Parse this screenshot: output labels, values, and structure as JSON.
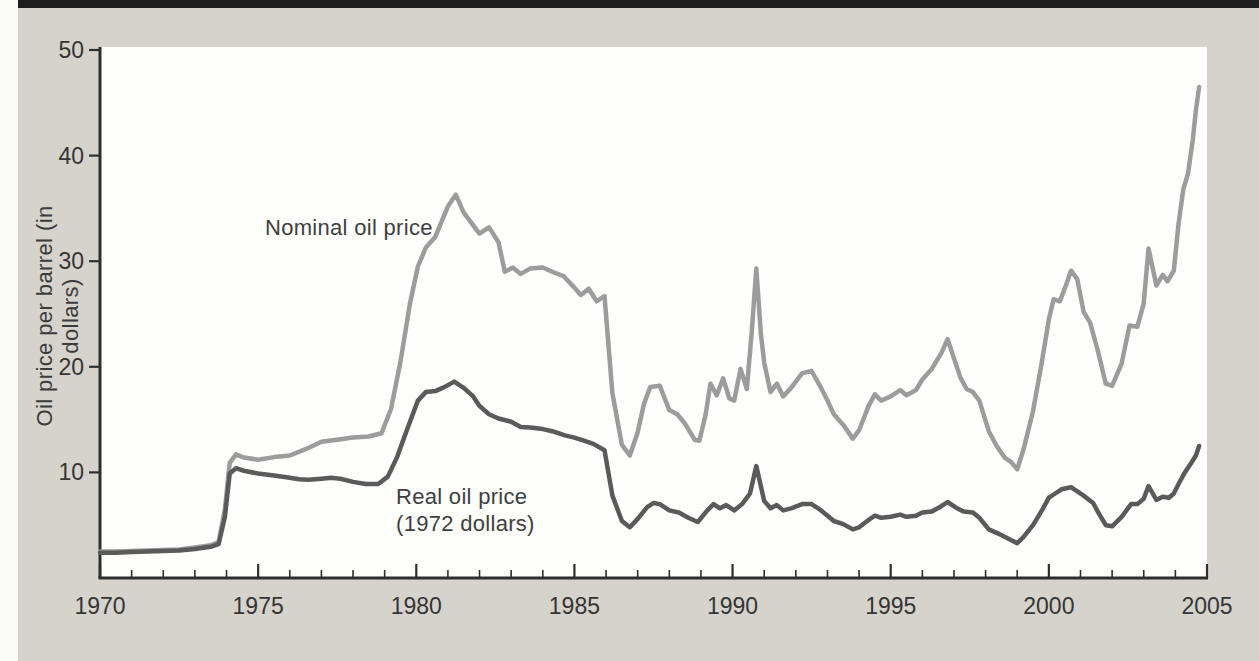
{
  "figure": {
    "y_axis_title": "Oil price per barrel (in dollars)",
    "nominal_label": "Nominal oil price",
    "real_label_line1": "Real oil price",
    "real_label_line2": "(1972 dollars)"
  },
  "colors": {
    "page_background": "#d5d3cc",
    "plot_background": "#fdfdfb",
    "top_bar": "#1e1e1e",
    "axis": "#2e2e2e",
    "tick_text": "#353535",
    "nominal_line": "#9c9c9c",
    "real_line": "#5a5a5a"
  },
  "chart_data": {
    "type": "line",
    "title": "",
    "xlabel": "",
    "ylabel": "Oil price per barrel (in dollars)",
    "xlim": [
      1970,
      2005
    ],
    "ylim": [
      0,
      50
    ],
    "x_ticks_major": [
      1970,
      1975,
      1980,
      1985,
      1990,
      1995,
      2000,
      2005
    ],
    "x_minor_tick_step_years": 1,
    "y_ticks": [
      10,
      20,
      30,
      40,
      50
    ],
    "grid": false,
    "legend": "inline annotations on lines",
    "annotations": [
      "Nominal oil price",
      "Real oil price (1972 dollars)"
    ],
    "series": [
      {
        "name": "Nominal oil price",
        "color_key": "nominal_line",
        "points": [
          [
            1970.0,
            2.5
          ],
          [
            1970.5,
            2.5
          ],
          [
            1971.0,
            2.55
          ],
          [
            1971.5,
            2.6
          ],
          [
            1972.0,
            2.65
          ],
          [
            1972.5,
            2.7
          ],
          [
            1973.0,
            2.9
          ],
          [
            1973.5,
            3.1
          ],
          [
            1973.75,
            3.4
          ],
          [
            1973.95,
            6.5
          ],
          [
            1974.1,
            10.9
          ],
          [
            1974.3,
            11.7
          ],
          [
            1974.55,
            11.4
          ],
          [
            1975.0,
            11.2
          ],
          [
            1975.5,
            11.45
          ],
          [
            1976.0,
            11.6
          ],
          [
            1976.5,
            12.2
          ],
          [
            1977.0,
            12.9
          ],
          [
            1977.5,
            13.1
          ],
          [
            1978.0,
            13.3
          ],
          [
            1978.5,
            13.4
          ],
          [
            1978.9,
            13.7
          ],
          [
            1979.2,
            16.0
          ],
          [
            1979.5,
            20.5
          ],
          [
            1979.8,
            26.0
          ],
          [
            1980.05,
            29.5
          ],
          [
            1980.3,
            31.3
          ],
          [
            1980.6,
            32.3
          ],
          [
            1981.0,
            35.2
          ],
          [
            1981.25,
            36.3
          ],
          [
            1981.5,
            34.6
          ],
          [
            1981.75,
            33.6
          ],
          [
            1982.0,
            32.6
          ],
          [
            1982.3,
            33.2
          ],
          [
            1982.6,
            31.8
          ],
          [
            1982.8,
            29.0
          ],
          [
            1983.05,
            29.4
          ],
          [
            1983.3,
            28.8
          ],
          [
            1983.6,
            29.3
          ],
          [
            1984.0,
            29.4
          ],
          [
            1984.3,
            29.0
          ],
          [
            1984.65,
            28.6
          ],
          [
            1985.0,
            27.5
          ],
          [
            1985.2,
            26.8
          ],
          [
            1985.45,
            27.4
          ],
          [
            1985.7,
            26.2
          ],
          [
            1985.95,
            26.7
          ],
          [
            1986.2,
            17.5
          ],
          [
            1986.5,
            12.6
          ],
          [
            1986.75,
            11.6
          ],
          [
            1987.0,
            13.8
          ],
          [
            1987.2,
            16.5
          ],
          [
            1987.4,
            18.1
          ],
          [
            1987.7,
            18.2
          ],
          [
            1988.0,
            15.9
          ],
          [
            1988.25,
            15.5
          ],
          [
            1988.5,
            14.6
          ],
          [
            1988.8,
            13.1
          ],
          [
            1988.95,
            13.0
          ],
          [
            1989.15,
            15.5
          ],
          [
            1989.3,
            18.4
          ],
          [
            1989.5,
            17.3
          ],
          [
            1989.7,
            18.9
          ],
          [
            1989.9,
            17.0
          ],
          [
            1990.05,
            16.8
          ],
          [
            1990.25,
            19.8
          ],
          [
            1990.45,
            17.9
          ],
          [
            1990.6,
            23.0
          ],
          [
            1990.75,
            29.3
          ],
          [
            1990.9,
            23.0
          ],
          [
            1991.0,
            20.4
          ],
          [
            1991.2,
            17.6
          ],
          [
            1991.4,
            18.4
          ],
          [
            1991.6,
            17.2
          ],
          [
            1991.85,
            18.0
          ],
          [
            1992.2,
            19.4
          ],
          [
            1992.5,
            19.6
          ],
          [
            1992.8,
            18.0
          ],
          [
            1993.0,
            16.8
          ],
          [
            1993.2,
            15.5
          ],
          [
            1993.5,
            14.5
          ],
          [
            1993.8,
            13.2
          ],
          [
            1994.0,
            14.0
          ],
          [
            1994.3,
            16.3
          ],
          [
            1994.5,
            17.4
          ],
          [
            1994.7,
            16.8
          ],
          [
            1995.0,
            17.2
          ],
          [
            1995.3,
            17.8
          ],
          [
            1995.5,
            17.3
          ],
          [
            1995.8,
            17.8
          ],
          [
            1996.0,
            18.8
          ],
          [
            1996.3,
            19.8
          ],
          [
            1996.6,
            21.3
          ],
          [
            1996.8,
            22.6
          ],
          [
            1997.0,
            20.8
          ],
          [
            1997.2,
            19.0
          ],
          [
            1997.4,
            17.9
          ],
          [
            1997.6,
            17.6
          ],
          [
            1997.8,
            16.8
          ],
          [
            1998.1,
            13.9
          ],
          [
            1998.35,
            12.5
          ],
          [
            1998.6,
            11.4
          ],
          [
            1998.8,
            11.0
          ],
          [
            1999.0,
            10.3
          ],
          [
            1999.2,
            12.2
          ],
          [
            1999.5,
            15.8
          ],
          [
            1999.75,
            20.0
          ],
          [
            2000.0,
            24.5
          ],
          [
            2000.15,
            26.4
          ],
          [
            2000.35,
            26.2
          ],
          [
            2000.55,
            27.8
          ],
          [
            2000.7,
            29.1
          ],
          [
            2000.9,
            28.3
          ],
          [
            2001.1,
            25.2
          ],
          [
            2001.3,
            24.2
          ],
          [
            2001.55,
            21.5
          ],
          [
            2001.8,
            18.4
          ],
          [
            2002.0,
            18.2
          ],
          [
            2002.3,
            20.3
          ],
          [
            2002.55,
            23.9
          ],
          [
            2002.8,
            23.8
          ],
          [
            2003.0,
            26.0
          ],
          [
            2003.15,
            31.2
          ],
          [
            2003.4,
            27.7
          ],
          [
            2003.6,
            28.7
          ],
          [
            2003.75,
            28.1
          ],
          [
            2003.95,
            29.1
          ],
          [
            2004.1,
            33.5
          ],
          [
            2004.25,
            36.8
          ],
          [
            2004.4,
            38.3
          ],
          [
            2004.55,
            41.5
          ],
          [
            2004.65,
            44.3
          ],
          [
            2004.75,
            46.5
          ]
        ]
      },
      {
        "name": "Real oil price (1972 dollars)",
        "color_key": "real_line",
        "points": [
          [
            1970.0,
            2.4
          ],
          [
            1970.5,
            2.4
          ],
          [
            1971.0,
            2.45
          ],
          [
            1971.5,
            2.5
          ],
          [
            1972.0,
            2.55
          ],
          [
            1972.5,
            2.6
          ],
          [
            1973.0,
            2.75
          ],
          [
            1973.5,
            2.95
          ],
          [
            1973.75,
            3.2
          ],
          [
            1973.95,
            5.8
          ],
          [
            1974.1,
            9.9
          ],
          [
            1974.3,
            10.4
          ],
          [
            1974.55,
            10.15
          ],
          [
            1975.0,
            9.9
          ],
          [
            1975.5,
            9.7
          ],
          [
            1976.0,
            9.5
          ],
          [
            1976.3,
            9.35
          ],
          [
            1976.6,
            9.3
          ],
          [
            1977.0,
            9.4
          ],
          [
            1977.3,
            9.5
          ],
          [
            1977.6,
            9.4
          ],
          [
            1978.0,
            9.1
          ],
          [
            1978.4,
            8.9
          ],
          [
            1978.8,
            8.9
          ],
          [
            1979.1,
            9.6
          ],
          [
            1979.4,
            11.5
          ],
          [
            1979.7,
            14.0
          ],
          [
            1980.05,
            16.8
          ],
          [
            1980.3,
            17.6
          ],
          [
            1980.6,
            17.7
          ],
          [
            1980.9,
            18.1
          ],
          [
            1981.2,
            18.6
          ],
          [
            1981.5,
            18.0
          ],
          [
            1981.8,
            17.2
          ],
          [
            1982.0,
            16.3
          ],
          [
            1982.3,
            15.5
          ],
          [
            1982.6,
            15.1
          ],
          [
            1983.0,
            14.8
          ],
          [
            1983.3,
            14.3
          ],
          [
            1983.6,
            14.25
          ],
          [
            1984.0,
            14.1
          ],
          [
            1984.3,
            13.9
          ],
          [
            1984.7,
            13.5
          ],
          [
            1985.0,
            13.3
          ],
          [
            1985.3,
            13.0
          ],
          [
            1985.6,
            12.7
          ],
          [
            1985.95,
            12.1
          ],
          [
            1986.2,
            7.8
          ],
          [
            1986.5,
            5.4
          ],
          [
            1986.75,
            4.8
          ],
          [
            1987.0,
            5.6
          ],
          [
            1987.3,
            6.7
          ],
          [
            1987.5,
            7.1
          ],
          [
            1987.7,
            7.0
          ],
          [
            1988.0,
            6.4
          ],
          [
            1988.3,
            6.2
          ],
          [
            1988.6,
            5.7
          ],
          [
            1988.9,
            5.3
          ],
          [
            1989.2,
            6.4
          ],
          [
            1989.4,
            7.0
          ],
          [
            1989.6,
            6.6
          ],
          [
            1989.8,
            6.9
          ],
          [
            1990.05,
            6.4
          ],
          [
            1990.3,
            7.0
          ],
          [
            1990.55,
            8.0
          ],
          [
            1990.75,
            10.6
          ],
          [
            1991.0,
            7.3
          ],
          [
            1991.2,
            6.6
          ],
          [
            1991.4,
            6.9
          ],
          [
            1991.6,
            6.4
          ],
          [
            1991.85,
            6.6
          ],
          [
            1992.2,
            7.0
          ],
          [
            1992.5,
            7.0
          ],
          [
            1992.8,
            6.4
          ],
          [
            1993.0,
            5.9
          ],
          [
            1993.2,
            5.4
          ],
          [
            1993.5,
            5.1
          ],
          [
            1993.8,
            4.6
          ],
          [
            1994.0,
            4.8
          ],
          [
            1994.3,
            5.5
          ],
          [
            1994.5,
            5.9
          ],
          [
            1994.7,
            5.7
          ],
          [
            1995.0,
            5.8
          ],
          [
            1995.3,
            6.0
          ],
          [
            1995.5,
            5.8
          ],
          [
            1995.8,
            5.9
          ],
          [
            1996.0,
            6.2
          ],
          [
            1996.3,
            6.3
          ],
          [
            1996.6,
            6.8
          ],
          [
            1996.8,
            7.2
          ],
          [
            1997.1,
            6.6
          ],
          [
            1997.3,
            6.3
          ],
          [
            1997.6,
            6.2
          ],
          [
            1997.8,
            5.7
          ],
          [
            1998.1,
            4.6
          ],
          [
            1998.4,
            4.2
          ],
          [
            1998.6,
            3.9
          ],
          [
            1998.8,
            3.6
          ],
          [
            1999.0,
            3.3
          ],
          [
            1999.2,
            3.9
          ],
          [
            1999.5,
            5.0
          ],
          [
            1999.8,
            6.5
          ],
          [
            2000.0,
            7.6
          ],
          [
            2000.2,
            8.0
          ],
          [
            2000.4,
            8.4
          ],
          [
            2000.7,
            8.6
          ],
          [
            2000.9,
            8.2
          ],
          [
            2001.1,
            7.8
          ],
          [
            2001.4,
            7.1
          ],
          [
            2001.6,
            6.0
          ],
          [
            2001.8,
            5.0
          ],
          [
            2002.0,
            4.9
          ],
          [
            2002.3,
            5.8
          ],
          [
            2002.6,
            7.0
          ],
          [
            2002.8,
            7.0
          ],
          [
            2003.0,
            7.5
          ],
          [
            2003.15,
            8.7
          ],
          [
            2003.4,
            7.4
          ],
          [
            2003.6,
            7.7
          ],
          [
            2003.8,
            7.6
          ],
          [
            2003.95,
            8.0
          ],
          [
            2004.1,
            8.9
          ],
          [
            2004.3,
            10.0
          ],
          [
            2004.5,
            10.9
          ],
          [
            2004.65,
            11.6
          ],
          [
            2004.75,
            12.5
          ]
        ]
      }
    ]
  }
}
